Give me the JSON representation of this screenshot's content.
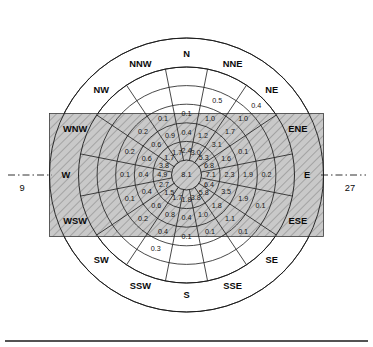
{
  "figure": {
    "kind": "wind-rose",
    "center_label": "8.1",
    "axis_left_label": "9",
    "axis_right_label": "27",
    "colors": {
      "band_fill": "#bdbdbd",
      "hatch_stroke": "#8f8f8f",
      "line": "#1a1a1a",
      "text": "#151515",
      "background": "#ffffff"
    }
  },
  "directions": [
    {
      "name": "N",
      "label": "N",
      "angle_deg": 0
    },
    {
      "name": "NNE",
      "label": "NNE",
      "angle_deg": 22.5
    },
    {
      "name": "NE",
      "label": "NE",
      "angle_deg": 45
    },
    {
      "name": "ENE",
      "label": "ENE",
      "angle_deg": 67.5
    },
    {
      "name": "E",
      "label": "E",
      "angle_deg": 90
    },
    {
      "name": "ESE",
      "label": "ESE",
      "angle_deg": 112.5
    },
    {
      "name": "SE",
      "label": "SE",
      "angle_deg": 135
    },
    {
      "name": "SSE",
      "label": "SSE",
      "angle_deg": 157.5
    },
    {
      "name": "S",
      "label": "S",
      "angle_deg": 180
    },
    {
      "name": "SSW",
      "label": "SSW",
      "angle_deg": 202.5
    },
    {
      "name": "SW",
      "label": "SW",
      "angle_deg": 225
    },
    {
      "name": "WSW",
      "label": "WSW",
      "angle_deg": 247.5
    },
    {
      "name": "W",
      "label": "W",
      "angle_deg": 270
    },
    {
      "name": "WNW",
      "label": "WNW",
      "angle_deg": 292.5
    },
    {
      "name": "NW",
      "label": "NW",
      "angle_deg": 315
    },
    {
      "name": "NNW",
      "label": "NNW",
      "angle_deg": 337.5
    }
  ],
  "chart_data": {
    "type": "windrose",
    "title": "",
    "center_calm_percent": 8.1,
    "rings": 5,
    "ring_note": "values listed innermost ring first",
    "categories": [
      "N",
      "NNE",
      "NE",
      "ENE",
      "E",
      "ESE",
      "SE",
      "SSE",
      "S",
      "SSW",
      "SW",
      "WSW",
      "W",
      "WNW",
      "NW",
      "NNW"
    ],
    "sectors": [
      {
        "dir": "N",
        "values": [
          2.4,
          0.4,
          0.1
        ]
      },
      {
        "dir": "NNE",
        "values": [
          3.0,
          1.2,
          1.0,
          0.5
        ]
      },
      {
        "dir": "NE",
        "values": [
          5.3,
          3.1,
          1.7,
          1.0,
          0.4
        ]
      },
      {
        "dir": "ENE",
        "values": [
          6.8,
          1.6,
          0.1
        ]
      },
      {
        "dir": "E",
        "values": [
          7.1,
          2.3,
          1.9,
          0.2
        ]
      },
      {
        "dir": "ESE",
        "values": [
          6.4,
          3.5,
          1.9,
          0.1
        ]
      },
      {
        "dir": "SE",
        "values": [
          5.8,
          1.8,
          1.1,
          0.1
        ]
      },
      {
        "dir": "SSE",
        "values": [
          3.8,
          1.0,
          0.1
        ]
      },
      {
        "dir": "S",
        "values": [
          1.8,
          0.4,
          0.1
        ]
      },
      {
        "dir": "SSW",
        "values": [
          1.7,
          0.8,
          0.4,
          0.3
        ]
      },
      {
        "dir": "SW",
        "values": [
          1.5,
          0.6,
          0.2
        ]
      },
      {
        "dir": "WSW",
        "values": [
          2.7,
          0.4,
          0.1
        ]
      },
      {
        "dir": "W",
        "values": [
          4.9,
          0.4,
          0.1
        ]
      },
      {
        "dir": "WNW",
        "values": [
          3.8,
          0.6,
          0.2
        ]
      },
      {
        "dir": "NW",
        "values": [
          1.7,
          0.6,
          0.2
        ]
      },
      {
        "dir": "NNW",
        "values": [
          1.7,
          0.9,
          0.1
        ]
      }
    ],
    "runway_axis": {
      "left_heading": "9",
      "right_heading": "27",
      "orientation": "east-west"
    }
  }
}
